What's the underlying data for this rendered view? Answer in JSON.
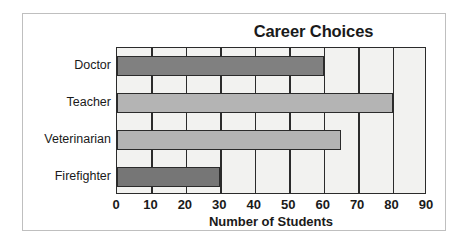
{
  "chart_data": {
    "type": "bar",
    "orientation": "horizontal",
    "title": "Career Choices",
    "xlabel": "Number of Students",
    "ylabel": "",
    "categories": [
      "Doctor",
      "Teacher",
      "Veterinarian",
      "Firefighter"
    ],
    "values": [
      60,
      80,
      65,
      30
    ],
    "bar_colors": [
      "#808080",
      "#b4b4b4",
      "#b4b4b4",
      "#767676"
    ],
    "xlim": [
      0,
      90
    ],
    "xticks": [
      0,
      10,
      20,
      30,
      40,
      50,
      60,
      70,
      80,
      90
    ],
    "xtick_labels": [
      "0",
      "10",
      "20",
      "30",
      "40",
      "50",
      "60",
      "70",
      "80",
      "90"
    ],
    "grid": true,
    "grid_axis": "x",
    "legend": null,
    "plot_background": "#f2f2f0",
    "axis_color": "#2b2b2b",
    "frame_color": "#bfbfbf"
  }
}
